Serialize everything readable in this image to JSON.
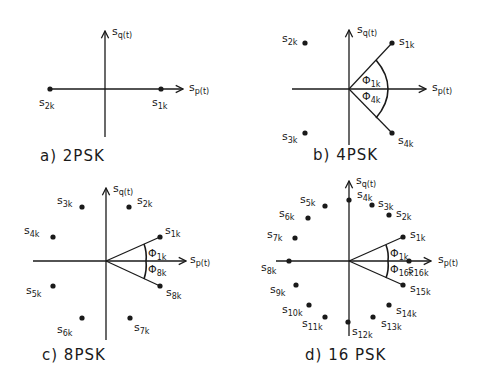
{
  "figure": {
    "axis_labels": {
      "horizontal": "sp(t)",
      "vertical": "sq(t)"
    },
    "panels": [
      {
        "id": "a",
        "title": "a) 2PSK",
        "points": [
          {
            "label": "s1k",
            "base": "s",
            "sub": "1k",
            "angle_deg": 0
          },
          {
            "label": "s2k",
            "base": "s",
            "sub": "2k",
            "angle_deg": 180
          }
        ],
        "angle_labels": []
      },
      {
        "id": "b",
        "title": "b) 4PSK",
        "points": [
          {
            "label": "s1k",
            "base": "s",
            "sub": "1k",
            "angle_deg": 45
          },
          {
            "label": "s2k",
            "base": "s",
            "sub": "2k",
            "angle_deg": 135
          },
          {
            "label": "s3k",
            "base": "s",
            "sub": "3k",
            "angle_deg": 225
          },
          {
            "label": "s4k",
            "base": "s",
            "sub": "4k",
            "angle_deg": 315
          }
        ],
        "angle_labels": [
          {
            "symbol": "Φ",
            "sub": "1k"
          },
          {
            "symbol": "Φ",
            "sub": "4k"
          }
        ]
      },
      {
        "id": "c",
        "title": "c) 8PSK",
        "points": [
          {
            "label": "s1k",
            "base": "s",
            "sub": "1k",
            "angle_deg": 22.5
          },
          {
            "label": "s2k",
            "base": "s",
            "sub": "2k",
            "angle_deg": 67.5
          },
          {
            "label": "s3k",
            "base": "s",
            "sub": "3k",
            "angle_deg": 112.5
          },
          {
            "label": "s4k",
            "base": "s",
            "sub": "4k",
            "angle_deg": 157.5
          },
          {
            "label": "s5k",
            "base": "s",
            "sub": "5k",
            "angle_deg": 202.5
          },
          {
            "label": "s6k",
            "base": "s",
            "sub": "6k",
            "angle_deg": 247.5
          },
          {
            "label": "s7k",
            "base": "s",
            "sub": "7k",
            "angle_deg": 292.5
          },
          {
            "label": "s8k",
            "base": "s",
            "sub": "8k",
            "angle_deg": 337.5
          }
        ],
        "angle_labels": [
          {
            "symbol": "Φ",
            "sub": "1k"
          },
          {
            "symbol": "Φ",
            "sub": "8k"
          }
        ]
      },
      {
        "id": "d",
        "title": "d) 16 PSK",
        "points": [
          {
            "label": "s1k",
            "base": "s",
            "sub": "1k"
          },
          {
            "label": "s2k",
            "base": "s",
            "sub": "2k"
          },
          {
            "label": "s3k",
            "base": "s",
            "sub": "3k"
          },
          {
            "label": "s4k",
            "base": "s",
            "sub": "4k"
          },
          {
            "label": "s5k",
            "base": "s",
            "sub": "5k"
          },
          {
            "label": "s6k",
            "base": "s",
            "sub": "6k"
          },
          {
            "label": "s7k",
            "base": "s",
            "sub": "7k"
          },
          {
            "label": "s8k",
            "base": "s",
            "sub": "8k"
          },
          {
            "label": "s9k",
            "base": "s",
            "sub": "9k"
          },
          {
            "label": "s10k",
            "base": "s",
            "sub": "10k"
          },
          {
            "label": "s11k",
            "base": "s",
            "sub": "11k"
          },
          {
            "label": "s12k",
            "base": "s",
            "sub": "12k"
          },
          {
            "label": "s13k",
            "base": "s",
            "sub": "13k"
          },
          {
            "label": "s14k",
            "base": "s",
            "sub": "14k"
          },
          {
            "label": "s15k",
            "base": "s",
            "sub": "15k"
          },
          {
            "label": "s16k",
            "base": "s",
            "sub": "16k"
          }
        ],
        "angle_labels": [
          {
            "symbol": "Φ",
            "sub": "1k"
          },
          {
            "symbol": "Φ",
            "sub": "16k"
          }
        ]
      }
    ]
  },
  "text": {
    "s": "s",
    "p_t": "p(t)",
    "q_t": "q(t)",
    "phi": "Φ",
    "a_title": "a) 2PSK",
    "b_title": "b) 4PSK",
    "c_title": "c) 8PSK",
    "d_title": "d) 16 PSK",
    "sub_1k": "1k",
    "sub_2k": "2k",
    "sub_3k": "3k",
    "sub_4k": "4k",
    "sub_5k": "5k",
    "sub_6k": "6k",
    "sub_7k": "7k",
    "sub_8k": "8k",
    "sub_9k": "9k",
    "sub_10k": "10k",
    "sub_11k": "11k",
    "sub_12k": "12k",
    "sub_13k": "13k",
    "sub_14k": "14k",
    "sub_15k": "15k",
    "sub_16k": "16k"
  }
}
